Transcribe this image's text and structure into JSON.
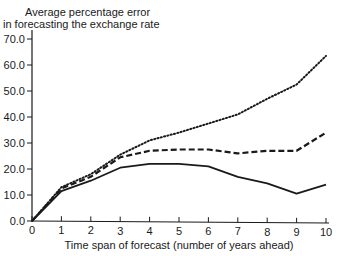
{
  "chart_data": {
    "type": "line",
    "title": "",
    "ylabel": "Average percentage error in forecasting the exchange rate",
    "ylabel_lines": [
      "Average percentage error",
      "in forecasting the exchange rate"
    ],
    "xlabel": "Time span of forecast (number of years ahead)",
    "x": [
      0,
      1,
      2,
      3,
      4,
      5,
      6,
      7,
      8,
      9,
      10
    ],
    "x_tick_labels": [
      "0",
      "1",
      "2",
      "3",
      "4",
      "5",
      "6",
      "7",
      "8",
      "9",
      "10"
    ],
    "y_tick_labels": [
      "0.0",
      "10.0",
      "20.0",
      "30.0",
      "40.0",
      "50.0",
      "60.0",
      "70.0"
    ],
    "y_ticks": [
      0,
      10,
      20,
      30,
      40,
      50,
      60,
      70
    ],
    "ylim": [
      0,
      72
    ],
    "xlim": [
      0,
      10
    ],
    "grid": false,
    "legend": "none",
    "series": [
      {
        "name": "Dotted line",
        "style": "dotted",
        "values": [
          0,
          13,
          18,
          25.5,
          31,
          34,
          37.5,
          41,
          47,
          52.5,
          63.5
        ]
      },
      {
        "name": "Dashed line",
        "style": "dashed",
        "values": [
          0,
          12.5,
          17,
          24.5,
          27,
          27.5,
          27.5,
          26,
          27,
          27,
          34
        ]
      },
      {
        "name": "Solid line",
        "style": "solid",
        "values": [
          0,
          11.5,
          15.5,
          20.5,
          22,
          22,
          21,
          17,
          14.5,
          10.5,
          14
        ]
      }
    ]
  }
}
